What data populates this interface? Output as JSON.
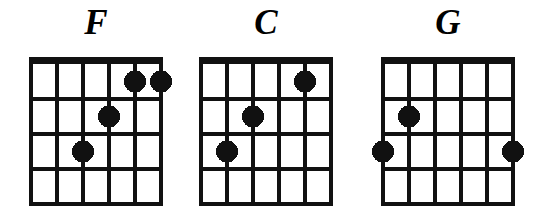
{
  "page": {
    "background_color": "#ffffff",
    "ink_color": "#111111",
    "width": 549,
    "height": 219
  },
  "diagram_spec": {
    "string_count": 6,
    "fret_count": 4,
    "nut_thickness": 7,
    "line_thickness": 4,
    "dot_radius": 11,
    "cell_width": 26,
    "cell_height": 35,
    "grid_width": 135,
    "grid_height": 147
  },
  "chords": [
    {
      "name": "F",
      "label": "F",
      "origin_x": 31,
      "dots": [
        {
          "string": 5,
          "fret": 1
        },
        {
          "string": 6,
          "fret": 1
        },
        {
          "string": 4,
          "fret": 2
        },
        {
          "string": 3,
          "fret": 3
        }
      ]
    },
    {
      "name": "C",
      "label": "C",
      "origin_x": 201,
      "dots": [
        {
          "string": 5,
          "fret": 1
        },
        {
          "string": 3,
          "fret": 2
        },
        {
          "string": 2,
          "fret": 3
        }
      ]
    },
    {
      "name": "G",
      "label": "G",
      "origin_x": 383,
      "dots": [
        {
          "string": 2,
          "fret": 2
        },
        {
          "string": 1,
          "fret": 3
        },
        {
          "string": 6,
          "fret": 3
        }
      ]
    }
  ],
  "chart_data": {
    "type": "table",
    "xlabel": "String (1 = leftmost as drawn, 6 = rightmost as drawn)",
    "ylabel": "Fret",
    "columns": [
      "Chord",
      "Fret 1",
      "Fret 2",
      "Fret 3",
      "Fret 4"
    ],
    "rows": [
      [
        "F",
        "strings 5, 6",
        "string 4",
        "string 3",
        ""
      ],
      [
        "C",
        "string 5",
        "string 3",
        "string 2",
        ""
      ],
      [
        "G",
        "",
        "string 2",
        "strings 1, 6",
        ""
      ]
    ],
    "series": [
      {
        "name": "F",
        "values": [
          {
            "string": 5,
            "fret": 1
          },
          {
            "string": 6,
            "fret": 1
          },
          {
            "string": 4,
            "fret": 2
          },
          {
            "string": 3,
            "fret": 3
          }
        ]
      },
      {
        "name": "C",
        "values": [
          {
            "string": 5,
            "fret": 1
          },
          {
            "string": 3,
            "fret": 2
          },
          {
            "string": 2,
            "fret": 3
          }
        ]
      },
      {
        "name": "G",
        "values": [
          {
            "string": 2,
            "fret": 2
          },
          {
            "string": 1,
            "fret": 3
          },
          {
            "string": 6,
            "fret": 3
          }
        ]
      }
    ],
    "axis_ranges": {
      "string": [
        1,
        6
      ],
      "fret": [
        1,
        4
      ]
    },
    "grid": true,
    "legend": "none"
  }
}
